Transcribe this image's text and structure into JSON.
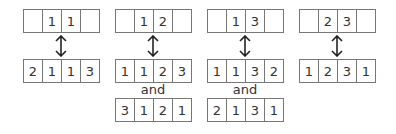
{
  "groups": [
    {
      "top": [
        "",
        "1",
        "1",
        ""
      ],
      "bottom": [
        "2",
        "1",
        "1",
        "3"
      ],
      "and_label": null,
      "extra": null
    },
    {
      "top": [
        "",
        "1",
        "2",
        ""
      ],
      "bottom": [
        "1",
        "1",
        "2",
        "3"
      ],
      "and_label": "and",
      "extra": [
        "3",
        "1",
        "2",
        "1"
      ]
    },
    {
      "top": [
        "",
        "1",
        "3",
        ""
      ],
      "bottom": [
        "1",
        "1",
        "3",
        "2"
      ],
      "and_label": "and",
      "extra": [
        "2",
        "1",
        "3",
        "1"
      ]
    },
    {
      "top": [
        "",
        "2",
        "3",
        ""
      ],
      "bottom": [
        "1",
        "2",
        "3",
        "1"
      ],
      "and_label": null,
      "extra": null
    }
  ],
  "icons": {
    "arrow": "up-down-arrow-icon"
  },
  "colors": {
    "border": "#777777",
    "text": "#333333",
    "background": "#ffffff"
  }
}
